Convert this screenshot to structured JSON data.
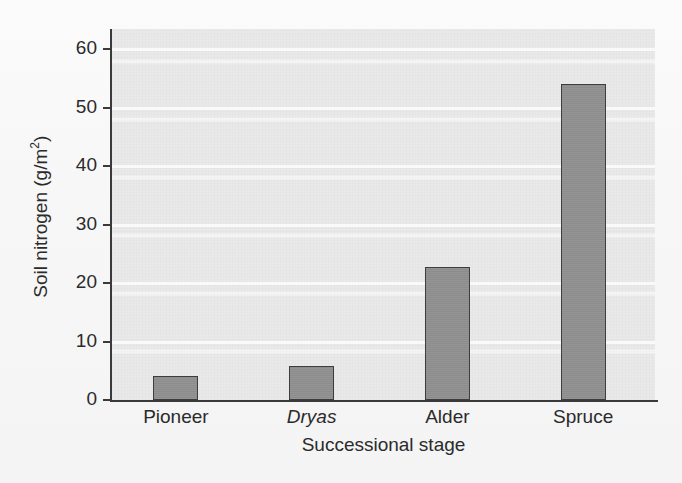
{
  "chart_data": {
    "type": "bar",
    "title": "",
    "subtitle": "",
    "categories": [
      "Pioneer",
      "Dryas",
      "Alder",
      "Spruce"
    ],
    "values": [
      4.1,
      5.8,
      22.8,
      54.0
    ],
    "xlabel": "Successional stage",
    "ylabel": "Soil nitrogen (g/m2)",
    "ylabel_base": "Soil nitrogen (g/m",
    "ylabel_exponent": "2",
    "ylabel_close": ")",
    "ylim": [
      0,
      62
    ],
    "yticks": [
      0,
      10,
      20,
      30,
      40,
      50,
      60
    ],
    "ytick_labels": [
      "0",
      "10",
      "20",
      "30",
      "40",
      "50",
      "60"
    ],
    "grid": true,
    "grid_axis": "y",
    "legend": false,
    "legend_position": "none",
    "italic_categories": [
      "Dryas"
    ],
    "colors": {
      "bar_fill": "#8f8f8f",
      "bar_outline": "#3d3d3d",
      "panel_background": "#e9e9e9",
      "gridline": "#ffffff",
      "axis": "#3a3a3a",
      "text": "#2b2b2b",
      "page_background": "#fbfbfb"
    }
  },
  "axis": {
    "y_ticks": [
      {
        "label": "60",
        "value": 60
      },
      {
        "label": "50",
        "value": 50
      },
      {
        "label": "40",
        "value": 40
      },
      {
        "label": "30",
        "value": 30
      },
      {
        "label": "20",
        "value": 20
      },
      {
        "label": "10",
        "value": 10
      },
      {
        "label": "0",
        "value": 0
      }
    ]
  },
  "bars": [
    {
      "label": "Pioneer",
      "value": 4.1,
      "italic": false
    },
    {
      "label": "Dryas",
      "value": 5.8,
      "italic": true
    },
    {
      "label": "Alder",
      "value": 22.8,
      "italic": false
    },
    {
      "label": "Spruce",
      "value": 54.0,
      "italic": false
    }
  ]
}
